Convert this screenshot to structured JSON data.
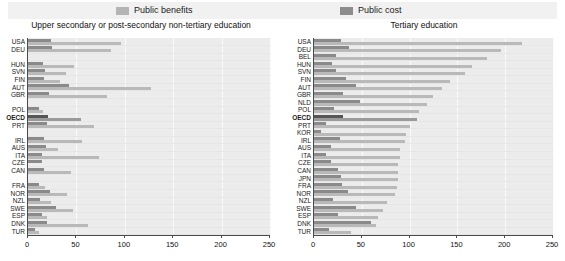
{
  "legend": {
    "items": [
      {
        "label": "Public benefits",
        "color": "#b9b9b9",
        "key": "benefits"
      },
      {
        "label": "Public cost",
        "color": "#8a8a8a",
        "key": "cost"
      }
    ]
  },
  "chart_data": [
    {
      "id": "upper-secondary",
      "type": "bar",
      "orientation": "horizontal",
      "title": "Upper secondary or post-secondary non-tertiary education",
      "xlabel": "",
      "ylabel": "",
      "xlim": [
        0,
        250
      ],
      "xticks": [
        0,
        50,
        100,
        150,
        200,
        250
      ],
      "grid": true,
      "legend_position": "top",
      "categories": [
        "USA",
        "DEU",
        "",
        "HUN",
        "SVN",
        "FIN",
        "AUT",
        "GBR",
        "",
        "POL",
        "OECD",
        "PRT",
        "",
        "IRL",
        "AUS",
        "ITA",
        "CZE",
        "CAN",
        "",
        "FRA",
        "NOR",
        "NZL",
        "SWE",
        "ESP",
        "DNK",
        "TUR"
      ],
      "series": [
        {
          "name": "Public cost",
          "values": [
            24,
            25,
            null,
            15,
            18,
            17,
            42,
            22,
            null,
            11,
            21,
            20,
            null,
            17,
            19,
            14,
            14,
            17,
            null,
            11,
            23,
            12,
            29,
            14,
            20,
            7
          ]
        },
        {
          "name": "Public benefits",
          "values": [
            96,
            86,
            null,
            48,
            39,
            33,
            127,
            82,
            null,
            16,
            55,
            68,
            null,
            56,
            31,
            73,
            null,
            44,
            null,
            18,
            40,
            24,
            46,
            20,
            62,
            11
          ]
        }
      ]
    },
    {
      "id": "tertiary",
      "type": "bar",
      "orientation": "horizontal",
      "title": "Tertiary education",
      "xlabel": "",
      "ylabel": "",
      "xlim": [
        0,
        250
      ],
      "xticks": [
        0,
        50,
        100,
        150,
        200,
        250
      ],
      "grid": true,
      "legend_position": "top",
      "categories": [
        "USA",
        "DEU",
        "BEL",
        "HUN",
        "SVN",
        "FIN",
        "AUT",
        "GBR",
        "NLD",
        "POL",
        "OECD",
        "PRT",
        "KOR",
        "IRL",
        "AUS",
        "ITA",
        "CZE",
        "CAN",
        "JPN",
        "FRA",
        "NOR",
        "NZL",
        "SWE",
        "ESP",
        "DNK",
        "TUR"
      ],
      "series": [
        {
          "name": "Public cost",
          "values": [
            28,
            37,
            23,
            19,
            23,
            33,
            44,
            30,
            48,
            21,
            30,
            13,
            7,
            27,
            18,
            13,
            18,
            25,
            28,
            29,
            36,
            20,
            44,
            25,
            60,
            16
          ]
        },
        {
          "name": "Public benefits",
          "values": [
            218,
            196,
            181,
            165,
            158,
            142,
            134,
            124,
            118,
            110,
            108,
            100,
            96,
            95,
            90,
            90,
            88,
            88,
            88,
            87,
            85,
            76,
            72,
            67,
            65,
            39
          ]
        }
      ]
    }
  ]
}
